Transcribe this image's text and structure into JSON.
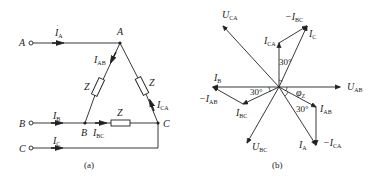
{
  "figure_a": {
    "caption": "(a)",
    "terminals": [
      {
        "name": "A",
        "current": "I",
        "current_sub": "A"
      },
      {
        "name": "B",
        "current": "I",
        "current_sub": "B"
      },
      {
        "name": "C",
        "current": "I",
        "current_sub": "C"
      }
    ],
    "nodes": {
      "A": "A",
      "B": "B",
      "C": "C"
    },
    "impedances": [
      "Z",
      "Z",
      "Z"
    ],
    "phase_currents": [
      {
        "label": "I",
        "sub": "AB"
      },
      {
        "label": "I",
        "sub": "BC"
      },
      {
        "label": "I",
        "sub": "CA"
      }
    ]
  },
  "figure_b": {
    "caption": "(b)",
    "voltages": [
      {
        "label": "U",
        "sub": "AB"
      },
      {
        "label": "U",
        "sub": "BC"
      },
      {
        "label": "U",
        "sub": "CA"
      }
    ],
    "currents": {
      "I_A": {
        "label": "I",
        "sub": "A"
      },
      "I_B": {
        "label": "I",
        "sub": "B"
      },
      "I_C": {
        "label": "I",
        "sub": "C"
      },
      "I_AB": {
        "label": "I",
        "sub": "AB"
      },
      "I_BC": {
        "label": "I",
        "sub": "BC"
      },
      "I_CA": {
        "label": "I",
        "sub": "CA"
      },
      "neg_I_AB": {
        "label": "−I",
        "sub": "AB"
      },
      "neg_I_BC": {
        "label": "−I",
        "sub": "BC"
      },
      "neg_I_CA": {
        "label": "−I",
        "sub": "CA"
      }
    },
    "angles": {
      "a1": "30°",
      "a2": "30°",
      "a3": "30°",
      "phi": "φ",
      "phi_sub": "Z"
    }
  }
}
